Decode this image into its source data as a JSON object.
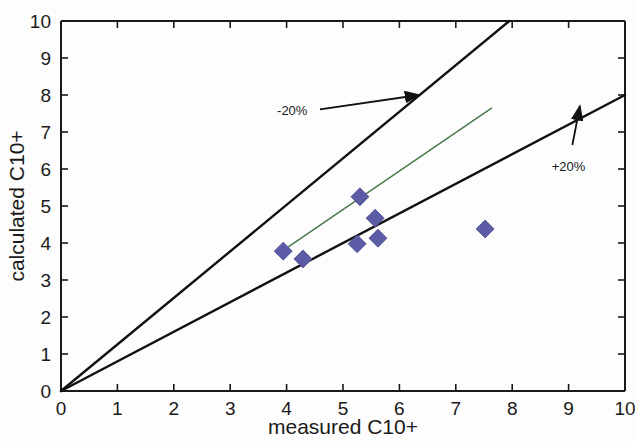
{
  "chart_data": {
    "type": "scatter",
    "title": "",
    "xlabel": "measured C10+",
    "ylabel": "calculated C10+",
    "xlim": [
      0,
      10
    ],
    "ylim": [
      0,
      10
    ],
    "xticks": [
      "0",
      "1",
      "2",
      "3",
      "4",
      "5",
      "6",
      "7",
      "8",
      "9",
      "10"
    ],
    "yticks": [
      "0",
      "1",
      "2",
      "3",
      "4",
      "5",
      "6",
      "7",
      "8",
      "9",
      "10"
    ],
    "grid": false,
    "legend": null,
    "marker_style": "diamond",
    "marker_color": "#5b5ba6",
    "points": [
      {
        "x": 3.94,
        "y": 3.78
      },
      {
        "x": 4.29,
        "y": 3.57
      },
      {
        "x": 5.3,
        "y": 5.25
      },
      {
        "x": 5.57,
        "y": 4.67
      },
      {
        "x": 5.25,
        "y": 3.98
      },
      {
        "x": 5.62,
        "y": 4.13
      },
      {
        "x": 7.52,
        "y": 4.38
      }
    ],
    "series": [
      {
        "name": "-20% deviation line",
        "type": "line",
        "color": "#111111",
        "x": [
          0,
          7.95
        ],
        "y": [
          0,
          10
        ]
      },
      {
        "name": "+20% deviation line",
        "type": "line",
        "color": "#111111",
        "x": [
          0,
          10
        ],
        "y": [
          0,
          8.0
        ]
      },
      {
        "name": "trend line",
        "type": "line",
        "color": "#4a7a4a",
        "x": [
          3.92,
          7.64
        ],
        "y": [
          3.78,
          7.65
        ]
      }
    ],
    "annotations": [
      {
        "text": "-20%",
        "x": 4.1,
        "y": 7.45,
        "arrow_to_x": 6.35,
        "arrow_to_y": 8.0
      },
      {
        "text": "+20%",
        "x": 9.0,
        "y": 5.95,
        "arrow_to_x": 9.2,
        "arrow_to_y": 7.7
      }
    ]
  },
  "axes": {
    "x_title": "measured C10+",
    "y_title": "calculated C10+"
  }
}
